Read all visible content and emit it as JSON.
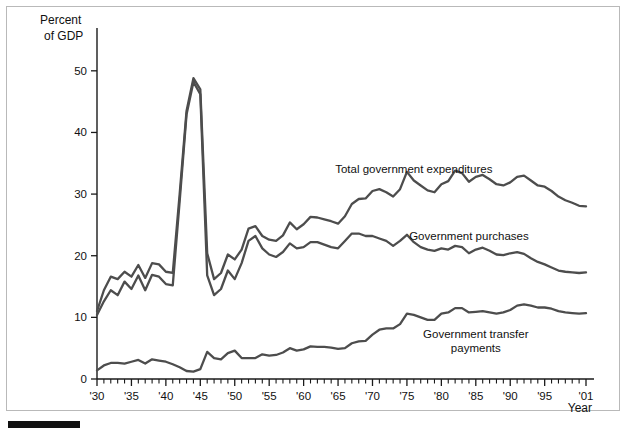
{
  "figure": {
    "y_axis_title_line1": "Percent",
    "y_axis_title_line2": "of GDP",
    "x_axis_title": "Year"
  },
  "chart_data": {
    "type": "line",
    "title": "",
    "xlabel": "Year",
    "ylabel": "Percent of GDP",
    "xlim": [
      1930,
      2001
    ],
    "ylim": [
      0,
      55
    ],
    "yticks": [
      0,
      10,
      20,
      30,
      40,
      50
    ],
    "ytick_labels": [
      "0",
      "10",
      "20",
      "30",
      "40",
      "50"
    ],
    "xticks": [
      1930,
      1935,
      1940,
      1945,
      1950,
      1955,
      1960,
      1965,
      1970,
      1975,
      1980,
      1985,
      1990,
      1995,
      2001
    ],
    "xtick_labels": [
      "'30",
      "'35",
      "'40",
      "'45",
      "'50",
      "'55",
      "'60",
      "'65",
      "'70",
      "'75",
      "'80",
      "'85",
      "'90",
      "'95",
      "'01"
    ],
    "minor_xtick_interval": 1,
    "grid": false,
    "legend_position": "inline-right",
    "x": [
      1930,
      1931,
      1932,
      1933,
      1934,
      1935,
      1936,
      1937,
      1938,
      1939,
      1940,
      1941,
      1942,
      1943,
      1944,
      1945,
      1946,
      1947,
      1948,
      1949,
      1950,
      1951,
      1952,
      1953,
      1954,
      1955,
      1956,
      1957,
      1958,
      1959,
      1960,
      1961,
      1962,
      1963,
      1964,
      1965,
      1966,
      1967,
      1968,
      1969,
      1970,
      1971,
      1972,
      1973,
      1974,
      1975,
      1976,
      1977,
      1978,
      1979,
      1980,
      1981,
      1982,
      1983,
      1984,
      1985,
      1986,
      1987,
      1988,
      1989,
      1990,
      1991,
      1992,
      1993,
      1994,
      1995,
      1996,
      1997,
      1998,
      1999,
      2000,
      2001
    ],
    "series": [
      {
        "name": "Total government expenditures",
        "label_x": 1976,
        "label_y": 33.5,
        "values": [
          11.0,
          14.4,
          16.6,
          16.2,
          17.4,
          16.6,
          18.5,
          16.4,
          18.8,
          18.6,
          17.4,
          17.2,
          30.0,
          43.5,
          48.8,
          47.0,
          20.4,
          16.2,
          17.2,
          20.2,
          19.4,
          21.0,
          24.4,
          24.8,
          23.2,
          22.6,
          22.4,
          23.3,
          25.4,
          24.3,
          25.1,
          26.3,
          26.2,
          25.9,
          25.6,
          25.2,
          26.4,
          28.4,
          29.2,
          29.3,
          30.5,
          30.8,
          30.3,
          29.6,
          30.8,
          33.6,
          32.2,
          31.4,
          30.6,
          30.3,
          31.6,
          32.1,
          33.8,
          33.4,
          32.0,
          32.8,
          33.1,
          32.4,
          31.6,
          31.4,
          31.9,
          32.8,
          33.0,
          32.2,
          31.4,
          31.2,
          30.5,
          29.6,
          29.0,
          28.6,
          28.1,
          28.0
        ]
      },
      {
        "name": "Government purchases",
        "label_x": 1984,
        "label_y": 22.5,
        "values": [
          10.4,
          12.6,
          14.4,
          13.6,
          15.8,
          14.6,
          16.8,
          14.4,
          16.9,
          16.6,
          15.4,
          15.2,
          28.8,
          42.9,
          48.2,
          46.2,
          16.8,
          13.6,
          14.6,
          17.6,
          16.2,
          18.8,
          22.4,
          23.2,
          21.2,
          20.2,
          19.8,
          20.6,
          22.0,
          21.2,
          21.4,
          22.2,
          22.2,
          21.8,
          21.4,
          21.2,
          22.4,
          23.6,
          23.6,
          23.2,
          23.2,
          22.8,
          22.4,
          21.6,
          22.4,
          23.4,
          22.2,
          21.4,
          21.0,
          20.8,
          21.2,
          21.0,
          21.6,
          21.4,
          20.4,
          21.0,
          21.3,
          20.8,
          20.2,
          20.1,
          20.4,
          20.6,
          20.3,
          19.6,
          19.0,
          18.6,
          18.1,
          17.6,
          17.4,
          17.3,
          17.2,
          17.3
        ]
      },
      {
        "name": "Government transfer payments",
        "label_x": 1985,
        "label_y": 6.6,
        "label_line2": "payments",
        "values": [
          1.4,
          2.2,
          2.6,
          2.6,
          2.5,
          2.8,
          3.1,
          2.5,
          3.2,
          3.0,
          2.8,
          2.4,
          1.9,
          1.3,
          1.2,
          1.6,
          4.4,
          3.4,
          3.2,
          4.2,
          4.6,
          3.4,
          3.4,
          3.4,
          4.0,
          3.8,
          3.9,
          4.3,
          5.0,
          4.6,
          4.8,
          5.3,
          5.2,
          5.2,
          5.1,
          4.9,
          5.0,
          5.8,
          6.1,
          6.2,
          7.2,
          8.0,
          8.2,
          8.2,
          8.9,
          10.6,
          10.4,
          10.0,
          9.6,
          9.6,
          10.6,
          10.8,
          11.5,
          11.5,
          10.8,
          10.9,
          11.0,
          10.8,
          10.6,
          10.8,
          11.2,
          11.9,
          12.1,
          11.9,
          11.6,
          11.6,
          11.4,
          11.0,
          10.8,
          10.7,
          10.6,
          10.7
        ]
      }
    ]
  },
  "series_labels": {
    "total_expenditures": "Total government expenditures",
    "purchases": "Government purchases",
    "transfers_line1": "Government transfer",
    "transfers_line2": "payments"
  },
  "colors": {
    "line": "#4d4d4d",
    "axis": "#1a1a1a",
    "frame": "#b9b9b9",
    "background": "#ffffff"
  }
}
